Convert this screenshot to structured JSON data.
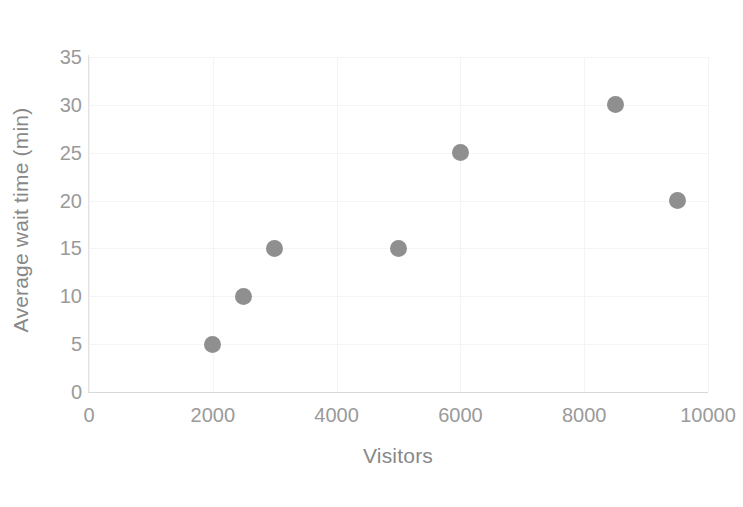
{
  "chart_data": {
    "type": "scatter",
    "title": "",
    "xlabel": "Visitors",
    "ylabel": "Average wait time (min)",
    "xlim": [
      0,
      10000
    ],
    "ylim": [
      0,
      35
    ],
    "grid": true,
    "legend": "none",
    "marker_color": "#8f8f8f",
    "axis_label_color": "#9a9a9a",
    "gridline_color": "#f4f4f4",
    "x_ticks": [
      0,
      2000,
      4000,
      6000,
      8000,
      10000
    ],
    "y_ticks": [
      0,
      5,
      10,
      15,
      20,
      25,
      30,
      35
    ],
    "x_tick_labels": [
      "0",
      "2000",
      "4000",
      "6000",
      "8000",
      "10000"
    ],
    "y_tick_labels": [
      "0",
      "5",
      "10",
      "15",
      "20",
      "25",
      "30",
      "35"
    ],
    "points": [
      {
        "x": 2000,
        "y": 5
      },
      {
        "x": 2500,
        "y": 10
      },
      {
        "x": 3000,
        "y": 15
      },
      {
        "x": 5000,
        "y": 15
      },
      {
        "x": 6000,
        "y": 25
      },
      {
        "x": 8500,
        "y": 30
      },
      {
        "x": 9500,
        "y": 20
      }
    ]
  }
}
